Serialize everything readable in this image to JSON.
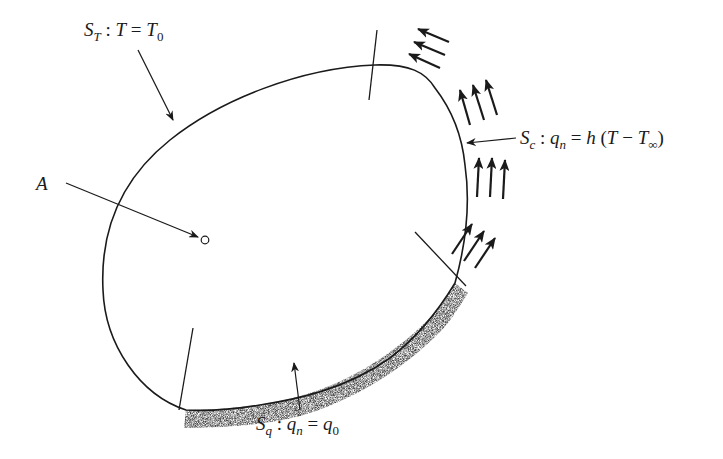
{
  "diagram": {
    "colors": {
      "stroke": "#1a1a1a",
      "background": "#ffffff",
      "stipple": "#555555"
    },
    "labels": {
      "dirichlet": {
        "S": "S",
        "S_sub": "T",
        "rest_pre": " : ",
        "T": "T",
        "eq": " = ",
        "T0": "T",
        "T0_sub": "0"
      },
      "convection": {
        "S": "S",
        "S_sub": "c",
        "colon": " : ",
        "q": "q",
        "q_sub": "n",
        "eq": " = ",
        "h": "h",
        "open": " (",
        "T": "T",
        "minus": " − ",
        "Tinf": "T",
        "Tinf_sub": "∞",
        "close": ")"
      },
      "flux": {
        "S": "S",
        "S_sub": "q",
        "colon": " : ",
        "q": "q",
        "q_sub": "n",
        "eq": " = ",
        "q0": "q",
        "q0_sub": "0"
      },
      "point": "A"
    },
    "boundary_segments": [
      {
        "name": "S_T",
        "condition": "T = T0",
        "type": "prescribed temperature"
      },
      {
        "name": "S_c",
        "condition": "q_n = h (T − T∞)",
        "type": "convection"
      },
      {
        "name": "S_q",
        "condition": "q_n = q0",
        "type": "prescribed heat flux"
      }
    ],
    "interior_point": "A"
  }
}
